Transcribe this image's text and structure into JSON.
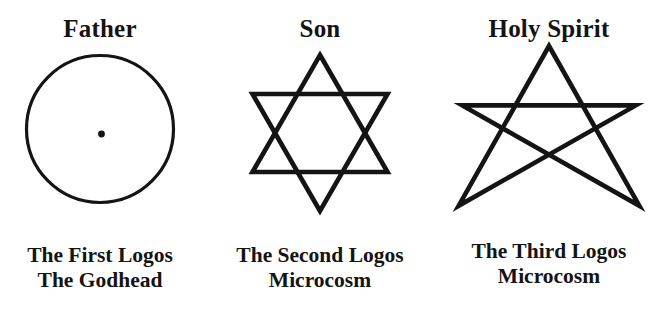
{
  "diagram": {
    "background_color": "#ffffff",
    "ink_color": "#141414",
    "columns": [
      {
        "id": "father",
        "heading": "Father",
        "symbol": "circle-with-center-dot",
        "caption_line1": "The First Logos",
        "caption_line2": "The Godhead"
      },
      {
        "id": "son",
        "heading": "Son",
        "symbol": "hexagram-star-of-david",
        "caption_line1": "The Second Logos",
        "caption_line2": "Microcosm"
      },
      {
        "id": "holy-spirit",
        "heading": "Holy Spirit",
        "symbol": "pentagram-five-pointed-star",
        "caption_line1": "The Third Logos",
        "caption_line2": "Microcosm"
      }
    ]
  }
}
